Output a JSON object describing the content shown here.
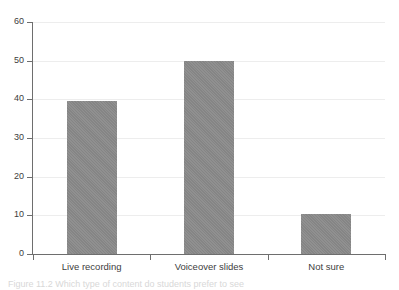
{
  "chart_data": {
    "type": "bar",
    "title": "",
    "subtitle": "",
    "xlabel": "",
    "ylabel": "",
    "categories": [
      "Live recording",
      "Voiceover slides",
      "Not sure"
    ],
    "values": [
      39.5,
      50,
      10.3
    ],
    "series": [
      {
        "name": "Responses",
        "values": [
          39.5,
          50,
          10.3
        ]
      }
    ],
    "ylim": [
      0,
      60
    ],
    "yticks": [
      0,
      10,
      20,
      30,
      40,
      50,
      60
    ],
    "ytick_labels": [
      "0",
      "10",
      "20",
      "30",
      "40",
      "50",
      "60"
    ],
    "grid": true,
    "grid_axis": "y",
    "legend": false,
    "legend_position": "none",
    "bar_color": "#8a8a8a",
    "axis_color": "#6e6e6e",
    "gridline_color": "#ededed",
    "background_color": "#ffffff",
    "annotations": []
  },
  "caption": {
    "text": "Figure 11.2   Which type of content do students prefer to see"
  }
}
